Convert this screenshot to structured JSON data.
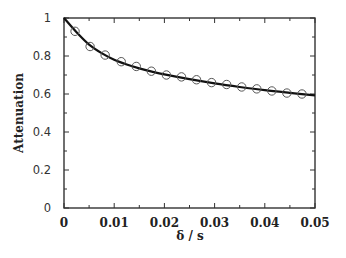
{
  "chart_data": {
    "type": "scatter",
    "title": "",
    "xlabel": "δ   / s",
    "ylabel": "Attenuation",
    "xlim": [
      0,
      0.05
    ],
    "ylim": [
      0,
      1
    ],
    "grid": false,
    "legend": null,
    "x_ticks": [
      0,
      0.01,
      0.02,
      0.03,
      0.04,
      0.05
    ],
    "x_tick_labels": [
      "0",
      "0.01",
      "0.02",
      "0.03",
      "0.04",
      "0.05"
    ],
    "y_ticks": [
      0,
      0.2,
      0.4,
      0.6,
      0.8,
      1
    ],
    "y_tick_labels": [
      "0",
      "0.2",
      "0.4",
      "0.6",
      "0.8",
      "1"
    ],
    "series": [
      {
        "name": "measured",
        "style": "open-circle",
        "x": [
          0.0022,
          0.0052,
          0.0082,
          0.0114,
          0.0144,
          0.0174,
          0.0204,
          0.0234,
          0.0264,
          0.0294,
          0.0324,
          0.0354,
          0.0384,
          0.0414,
          0.0444,
          0.0474
        ],
        "y": [
          0.93,
          0.85,
          0.805,
          0.77,
          0.745,
          0.72,
          0.7,
          0.69,
          0.675,
          0.66,
          0.65,
          0.637,
          0.627,
          0.616,
          0.605,
          0.6
        ]
      },
      {
        "name": "fit",
        "style": "solid-line",
        "x": [
          0,
          0.0025,
          0.005,
          0.0075,
          0.01,
          0.0125,
          0.015,
          0.0175,
          0.02,
          0.025,
          0.03,
          0.035,
          0.04,
          0.045,
          0.05
        ],
        "y": [
          1.0,
          0.925,
          0.86,
          0.815,
          0.78,
          0.755,
          0.735,
          0.718,
          0.703,
          0.678,
          0.656,
          0.637,
          0.62,
          0.606,
          0.593
        ]
      }
    ]
  },
  "colors": {
    "axis": "#333333",
    "line": "#111111",
    "marker": "#555555"
  }
}
